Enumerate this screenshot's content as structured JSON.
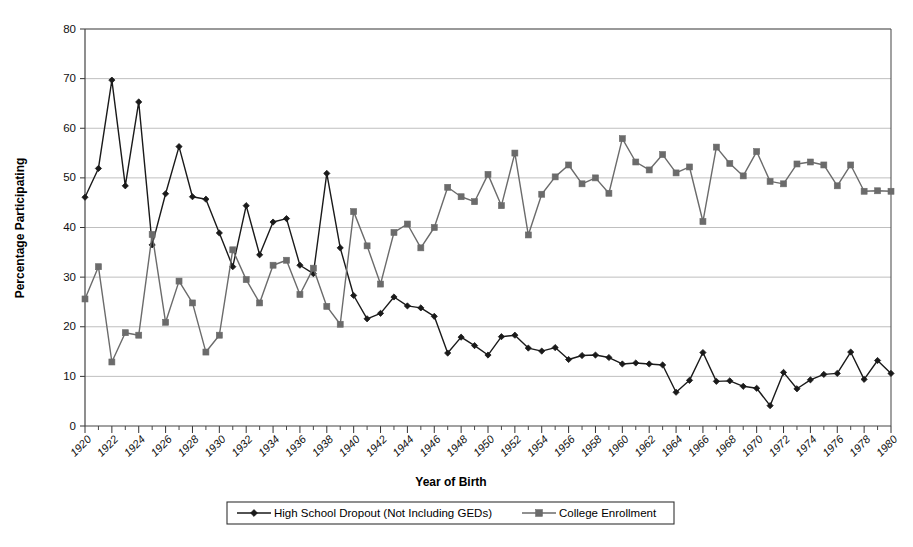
{
  "chart_data": {
    "type": "line",
    "title": "",
    "xlabel": "Year of Birth",
    "ylabel": "Percentage Participating",
    "xlim": [
      1920,
      1980
    ],
    "ylim": [
      0,
      80
    ],
    "ytick_step": 10,
    "xtick_step": 2,
    "grid": true,
    "legend_position": "bottom",
    "yticks": [
      0,
      10,
      20,
      30,
      40,
      50,
      60,
      70,
      80
    ],
    "xticks": [
      1920,
      1922,
      1924,
      1926,
      1928,
      1930,
      1932,
      1934,
      1936,
      1938,
      1940,
      1942,
      1944,
      1946,
      1948,
      1950,
      1952,
      1954,
      1956,
      1958,
      1960,
      1962,
      1964,
      1966,
      1968,
      1970,
      1972,
      1974,
      1976,
      1978,
      1980
    ],
    "x": [
      1920,
      1921,
      1922,
      1923,
      1924,
      1925,
      1926,
      1927,
      1928,
      1929,
      1930,
      1931,
      1932,
      1933,
      1934,
      1935,
      1936,
      1937,
      1938,
      1939,
      1940,
      1941,
      1942,
      1943,
      1944,
      1945,
      1946,
      1947,
      1948,
      1949,
      1950,
      1951,
      1952,
      1953,
      1954,
      1955,
      1956,
      1957,
      1958,
      1959,
      1960,
      1961,
      1962,
      1963,
      1964,
      1965,
      1966,
      1967,
      1968,
      1969,
      1970,
      1971,
      1972,
      1973,
      1974,
      1975,
      1976,
      1977,
      1978,
      1979,
      1980
    ],
    "series": [
      {
        "name": "High School Dropout (Not Including GEDs)",
        "color": "#1a1a1a",
        "marker": "diamond",
        "values": [
          46.1,
          51.9,
          69.7,
          48.4,
          65.3,
          36.5,
          46.8,
          56.3,
          46.2,
          45.7,
          38.9,
          32.1,
          44.4,
          34.5,
          41.1,
          41.8,
          32.4,
          30.7,
          50.9,
          35.9,
          26.3,
          21.6,
          22.7,
          26.0,
          24.2,
          23.8,
          22.1,
          14.7,
          17.9,
          16.2,
          14.3,
          18.0,
          18.3,
          15.7,
          15.1,
          15.8,
          13.4,
          14.2,
          14.3,
          13.8,
          12.5,
          12.7,
          12.5,
          12.3,
          6.8,
          9.2,
          14.8,
          9.0,
          9.1,
          8.0,
          7.6,
          4.1,
          10.8,
          7.5,
          9.3,
          10.4,
          10.6,
          14.9,
          9.4,
          13.2,
          10.6
        ]
      },
      {
        "name": "College Enrollment",
        "color": "#6b6b6b",
        "marker": "square",
        "values": [
          25.6,
          32.1,
          12.9,
          18.8,
          18.3,
          38.6,
          20.9,
          29.2,
          24.8,
          14.9,
          18.3,
          35.5,
          29.5,
          24.8,
          32.4,
          33.4,
          26.5,
          31.8,
          24.1,
          20.5,
          43.2,
          36.3,
          28.6,
          39.0,
          40.7,
          35.9,
          40.0,
          48.1,
          46.2,
          45.2,
          50.7,
          44.4,
          55.0,
          38.5,
          46.7,
          50.2,
          52.6,
          48.8,
          50.0,
          46.9,
          57.9,
          53.2,
          51.6,
          54.7,
          51.0,
          52.2,
          41.2,
          56.2,
          52.9,
          50.4,
          55.3,
          49.3,
          48.8,
          52.8,
          53.2,
          52.6,
          48.4,
          52.6,
          47.3,
          47.4,
          47.3
        ]
      }
    ]
  },
  "legend": {
    "items": [
      {
        "label": "High School Dropout (Not Including GEDs)"
      },
      {
        "label": "College Enrollment"
      }
    ]
  }
}
